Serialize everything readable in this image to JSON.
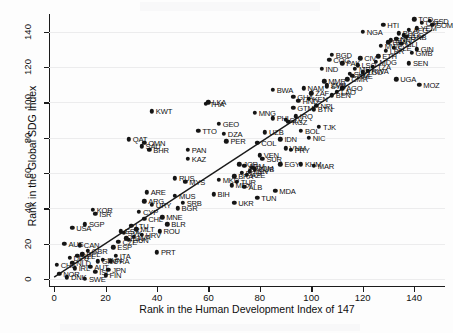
{
  "figure": {
    "background": "#fdfdfd",
    "marker_color": "#151515",
    "fit_line_color": "#1b1b1b",
    "grid_color": "#ececed"
  },
  "chart_data": {
    "type": "scatter",
    "title": "",
    "xlabel": "Rank in the Human Development Index of 147",
    "ylabel": "Rank in the Global SDG Index",
    "xlim": [
      -2,
      152
    ],
    "ylim": [
      -4,
      150
    ],
    "xticks": [
      0,
      20,
      40,
      60,
      80,
      100,
      120,
      140
    ],
    "yticks": [
      0,
      20,
      40,
      60,
      80,
      100,
      120,
      140
    ],
    "grid": "horizontal",
    "legend": "none",
    "fit_line": {
      "label": "linear fit",
      "x0": 0,
      "y0": 1,
      "x1": 147,
      "y1": 141
    },
    "point_label_field": "iso3",
    "points": [
      {
        "iso3": "DNK",
        "x": 5,
        "y": 1
      },
      {
        "iso3": "SWE",
        "x": 12,
        "y": 0
      },
      {
        "iso3": "FIN",
        "x": 20,
        "y": 2
      },
      {
        "iso3": "ISL",
        "x": 16,
        "y": 4
      },
      {
        "iso3": "NOR",
        "x": 2,
        "y": 3
      },
      {
        "iso3": "IRL",
        "x": 8,
        "y": 6
      },
      {
        "iso3": "CHE",
        "x": 1,
        "y": 8
      },
      {
        "iso3": "NLD",
        "x": 7,
        "y": 9
      },
      {
        "iso3": "AUT",
        "x": 14,
        "y": 7
      },
      {
        "iso3": "DEU",
        "x": 6,
        "y": 12
      },
      {
        "iso3": "BEL",
        "x": 11,
        "y": 14
      },
      {
        "iso3": "SVN",
        "x": 19,
        "y": 11
      },
      {
        "iso3": "FRA",
        "x": 22,
        "y": 10
      },
      {
        "iso3": "GBR",
        "x": 13,
        "y": 16
      },
      {
        "iso3": "JPN",
        "x": 21,
        "y": 5
      },
      {
        "iso3": "ITA",
        "x": 24,
        "y": 13
      },
      {
        "iso3": "EST",
        "x": 26,
        "y": 27
      },
      {
        "iso3": "PRT",
        "x": 40,
        "y": 15
      },
      {
        "iso3": "CZE",
        "x": 25,
        "y": 21
      },
      {
        "iso3": "POL",
        "x": 28,
        "y": 23
      },
      {
        "iso3": "ESP",
        "x": 23,
        "y": 18
      },
      {
        "iso3": "AUS",
        "x": 4,
        "y": 20
      },
      {
        "iso3": "CAN",
        "x": 10,
        "y": 19
      },
      {
        "iso3": "NZL",
        "x": 9,
        "y": 13
      },
      {
        "iso3": "GRC",
        "x": 17,
        "y": 10
      },
      {
        "iso3": "HRV",
        "x": 34,
        "y": 25
      },
      {
        "iso3": "LVA",
        "x": 31,
        "y": 24
      },
      {
        "iso3": "LTU",
        "x": 30,
        "y": 30
      },
      {
        "iso3": "SVK",
        "x": 27,
        "y": 26
      },
      {
        "iso3": "HUN",
        "x": 29,
        "y": 22
      },
      {
        "iso3": "CYP",
        "x": 33,
        "y": 38
      },
      {
        "iso3": "MLT",
        "x": 32,
        "y": 28
      },
      {
        "iso3": "ISR",
        "x": 16,
        "y": 37
      },
      {
        "iso3": "KOR",
        "x": 15,
        "y": 39
      },
      {
        "iso3": "USA",
        "x": 7,
        "y": 29
      },
      {
        "iso3": "SGP",
        "x": 12,
        "y": 31
      },
      {
        "iso3": "CHL",
        "x": 35,
        "y": 34
      },
      {
        "iso3": "ARE",
        "x": 36,
        "y": 49
      },
      {
        "iso3": "ARG",
        "x": 35,
        "y": 44
      },
      {
        "iso3": "URY",
        "x": 38,
        "y": 42
      },
      {
        "iso3": "MNE",
        "x": 42,
        "y": 35
      },
      {
        "iso3": "BLR",
        "x": 44,
        "y": 31
      },
      {
        "iso3": "ROU",
        "x": 41,
        "y": 27
      },
      {
        "iso3": "BGR",
        "x": 48,
        "y": 40
      },
      {
        "iso3": "SRB",
        "x": 50,
        "y": 43
      },
      {
        "iso3": "MUS",
        "x": 47,
        "y": 47
      },
      {
        "iso3": "RUS",
        "x": 47,
        "y": 57
      },
      {
        "iso3": "MYS",
        "x": 51,
        "y": 55
      },
      {
        "iso3": "KAZ",
        "x": 52,
        "y": 68
      },
      {
        "iso3": "OMN",
        "x": 35,
        "y": 77
      },
      {
        "iso3": "BHR",
        "x": 37,
        "y": 73
      },
      {
        "iso3": "SAU",
        "x": 34,
        "y": 75
      },
      {
        "iso3": "QAT",
        "x": 29,
        "y": 79
      },
      {
        "iso3": "KWT",
        "x": 38,
        "y": 95
      },
      {
        "iso3": "PAN",
        "x": 52,
        "y": 73
      },
      {
        "iso3": "TTO",
        "x": 56,
        "y": 84
      },
      {
        "iso3": "ALB",
        "x": 74,
        "y": 52
      },
      {
        "iso3": "MEX",
        "x": 69,
        "y": 53
      },
      {
        "iso3": "BRA",
        "x": 70,
        "y": 58
      },
      {
        "iso3": "PER",
        "x": 67,
        "y": 78
      },
      {
        "iso3": "COL",
        "x": 79,
        "y": 77
      },
      {
        "iso3": "CUB",
        "x": 78,
        "y": 62
      },
      {
        "iso3": "ARM",
        "x": 74,
        "y": 64
      },
      {
        "iso3": "JOR",
        "x": 72,
        "y": 65
      },
      {
        "iso3": "GEO",
        "x": 64,
        "y": 88
      },
      {
        "iso3": "DZA",
        "x": 66,
        "y": 82
      },
      {
        "iso3": "LKA",
        "x": 60,
        "y": 100
      },
      {
        "iso3": "THA",
        "x": 59,
        "y": 99
      },
      {
        "iso3": "ECU",
        "x": 73,
        "y": 60
      },
      {
        "iso3": "TUR",
        "x": 71,
        "y": 55
      },
      {
        "iso3": "UKR",
        "x": 70,
        "y": 43
      },
      {
        "iso3": "TUN",
        "x": 79,
        "y": 46
      },
      {
        "iso3": "MDA",
        "x": 86,
        "y": 50
      },
      {
        "iso3": "SUR",
        "x": 81,
        "y": 68
      },
      {
        "iso3": "EGY",
        "x": 88,
        "y": 65
      },
      {
        "iso3": "MAR",
        "x": 101,
        "y": 64
      },
      {
        "iso3": "KHM",
        "x": 96,
        "y": 65
      },
      {
        "iso3": "VNM",
        "x": 90,
        "y": 74
      },
      {
        "iso3": "PRY",
        "x": 92,
        "y": 73
      },
      {
        "iso3": "IDN",
        "x": 88,
        "y": 79
      },
      {
        "iso3": "BOL",
        "x": 96,
        "y": 84
      },
      {
        "iso3": "NIC",
        "x": 99,
        "y": 80
      },
      {
        "iso3": "TJK",
        "x": 103,
        "y": 86
      },
      {
        "iso3": "SLV",
        "x": 90,
        "y": 90
      },
      {
        "iso3": "PHL",
        "x": 85,
        "y": 91
      },
      {
        "iso3": "MNG",
        "x": 78,
        "y": 94
      },
      {
        "iso3": "BTN",
        "x": 101,
        "y": 96
      },
      {
        "iso3": "BWA",
        "x": 85,
        "y": 107
      },
      {
        "iso3": "NAM",
        "x": 97,
        "y": 108
      },
      {
        "iso3": "IND",
        "x": 104,
        "y": 119
      },
      {
        "iso3": "BGD",
        "x": 108,
        "y": 127
      },
      {
        "iso3": "COG",
        "x": 107,
        "y": 124
      },
      {
        "iso3": "PAK",
        "x": 112,
        "y": 122
      },
      {
        "iso3": "GHA",
        "x": 93,
        "y": 103
      },
      {
        "iso3": "KEN",
        "x": 99,
        "y": 102
      },
      {
        "iso3": "AGO",
        "x": 112,
        "y": 108
      },
      {
        "iso3": "ZMB",
        "x": 106,
        "y": 110
      },
      {
        "iso3": "MMR",
        "x": 105,
        "y": 112
      },
      {
        "iso3": "BEN",
        "x": 108,
        "y": 104
      },
      {
        "iso3": "NGA",
        "x": 120,
        "y": 140
      },
      {
        "iso3": "HTI",
        "x": 128,
        "y": 144
      },
      {
        "iso3": "TCD",
        "x": 140,
        "y": 147
      },
      {
        "iso3": "SSD",
        "x": 146,
        "y": 146
      },
      {
        "iso3": "CAF",
        "x": 143,
        "y": 145
      },
      {
        "iso3": "SOM",
        "x": 147,
        "y": 144
      },
      {
        "iso3": "AFG",
        "x": 138,
        "y": 141
      },
      {
        "iso3": "YEM",
        "x": 141,
        "y": 142
      },
      {
        "iso3": "COD",
        "x": 136,
        "y": 138
      },
      {
        "iso3": "NER",
        "x": 133,
        "y": 136
      },
      {
        "iso3": "MLI",
        "x": 135,
        "y": 133
      },
      {
        "iso3": "BFA",
        "x": 130,
        "y": 134
      },
      {
        "iso3": "SLE",
        "x": 132,
        "y": 131
      },
      {
        "iso3": "LBR",
        "x": 129,
        "y": 129
      },
      {
        "iso3": "GIN",
        "x": 141,
        "y": 130
      },
      {
        "iso3": "GMB",
        "x": 139,
        "y": 128
      },
      {
        "iso3": "SEN",
        "x": 138,
        "y": 122
      },
      {
        "iso3": "UGA",
        "x": 133,
        "y": 113
      },
      {
        "iso3": "MOZ",
        "x": 142,
        "y": 110
      },
      {
        "iso3": "TZA",
        "x": 124,
        "y": 120
      },
      {
        "iso3": "RWA",
        "x": 122,
        "y": 118
      },
      {
        "iso3": "ETH",
        "x": 126,
        "y": 126
      },
      {
        "iso3": "MWI",
        "x": 127,
        "y": 132
      },
      {
        "iso3": "TGO",
        "x": 120,
        "y": 117
      },
      {
        "iso3": "ZWE",
        "x": 116,
        "y": 115
      },
      {
        "iso3": "CMR",
        "x": 114,
        "y": 113
      },
      {
        "iso3": "SDN",
        "x": 131,
        "y": 135
      },
      {
        "iso3": "LSO",
        "x": 118,
        "y": 121
      },
      {
        "iso3": "NPL",
        "x": 102,
        "y": 98
      },
      {
        "iso3": "LAO",
        "x": 110,
        "y": 106
      },
      {
        "iso3": "CIV",
        "x": 119,
        "y": 125
      },
      {
        "iso3": "MRT",
        "x": 117,
        "y": 119
      },
      {
        "iso3": "SWZ",
        "x": 115,
        "y": 116
      },
      {
        "iso3": "BDI",
        "x": 134,
        "y": 139
      },
      {
        "iso3": "MDG",
        "x": 125,
        "y": 123
      },
      {
        "iso3": "GNB",
        "x": 137,
        "y": 137
      },
      {
        "iso3": "ZAF",
        "x": 100,
        "y": 105
      },
      {
        "iso3": "IRQ",
        "x": 94,
        "y": 92
      },
      {
        "iso3": "SYR",
        "x": 106,
        "y": 109
      },
      {
        "iso3": "UZB",
        "x": 82,
        "y": 83
      },
      {
        "iso3": "KGZ",
        "x": 91,
        "y": 89
      },
      {
        "iso3": "HND",
        "x": 95,
        "y": 101
      },
      {
        "iso3": "GTM",
        "x": 93,
        "y": 97
      },
      {
        "iso3": "VEN",
        "x": 80,
        "y": 70
      },
      {
        "iso3": "LBN",
        "x": 76,
        "y": 61
      },
      {
        "iso3": "AZE",
        "x": 75,
        "y": 59
      },
      {
        "iso3": "BIH",
        "x": 62,
        "y": 48
      },
      {
        "iso3": "MKD",
        "x": 64,
        "y": 56
      },
      {
        "iso3": "DOM",
        "x": 77,
        "y": 63
      }
    ]
  }
}
